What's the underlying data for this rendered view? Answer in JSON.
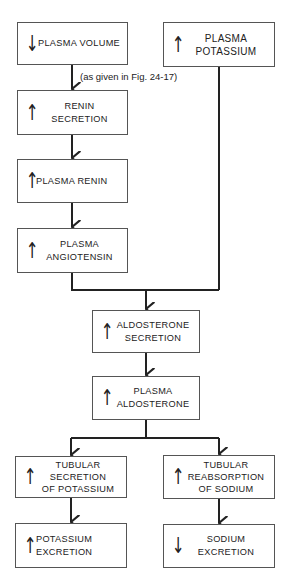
{
  "diagram": {
    "boxes": {
      "plasma_volume": {
        "arrow": "↓",
        "label": "PLASMA VOLUME"
      },
      "renin_secretion": {
        "arrow": "↑",
        "label": "RENIN\nSECRETION"
      },
      "plasma_renin": {
        "arrow": "↑",
        "label": "PLASMA RENIN"
      },
      "plasma_angiotensin": {
        "arrow": "↑",
        "label": "PLASMA\nANGIOTENSIN"
      },
      "plasma_potassium": {
        "arrow": "↑",
        "label": "PLASMA\nPOTASSIUM"
      },
      "aldosterone_secretion": {
        "arrow": "↑",
        "label": "ALDOSTERONE\nSECRETION"
      },
      "plasma_aldosterone": {
        "arrow": "↑",
        "label": "PLASMA\nALDOSTERONE"
      },
      "tubular_secretion_potassium": {
        "arrow": "↑",
        "label": "TUBULAR\nSECRETION\nOF POTASSIUM"
      },
      "tubular_reabsorption_sodium": {
        "arrow": "↑",
        "label": "TUBULAR\nREABSORPTION\nOF SODIUM"
      },
      "potassium_excretion": {
        "arrow": "↑",
        "label": "POTASSIUM\nEXCRETION"
      },
      "sodium_excretion": {
        "arrow": "↓",
        "label": "SODIUM\nEXCRETION"
      }
    },
    "note": "(as given in Fig. 24-17)",
    "line_color": "#222222"
  }
}
